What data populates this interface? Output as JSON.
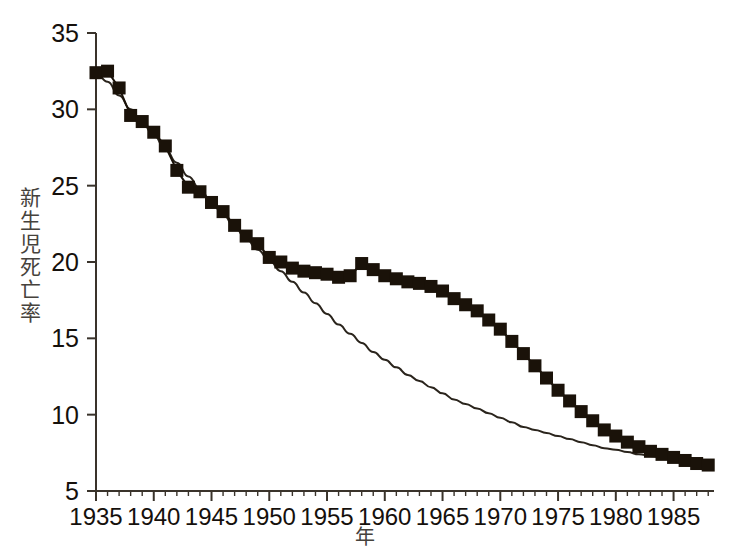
{
  "chart_data": {
    "type": "line",
    "title": "",
    "xlabel": "年",
    "ylabel": "新生児死亡率",
    "xlim": [
      1935,
      1988.5
    ],
    "ylim": [
      5,
      35
    ],
    "grid": false,
    "legend": "none",
    "xticks": [
      1935,
      1940,
      1945,
      1950,
      1955,
      1960,
      1965,
      1970,
      1975,
      1980,
      1985
    ],
    "xticklabels": [
      "1935",
      "1940",
      "1945",
      "1950",
      "1955",
      "1960",
      "1965",
      "1970",
      "1975",
      "1980",
      "1985"
    ],
    "yticks": [
      5,
      10,
      15,
      20,
      25,
      30,
      35
    ],
    "yticklabels": [
      "5",
      "10",
      "15",
      "20",
      "25",
      "30",
      "35"
    ],
    "minor_xtick_interval": 1,
    "x": [
      1935,
      1936,
      1937,
      1938,
      1939,
      1940,
      1941,
      1942,
      1943,
      1944,
      1945,
      1946,
      1947,
      1948,
      1949,
      1950,
      1951,
      1952,
      1953,
      1954,
      1955,
      1956,
      1957,
      1958,
      1959,
      1960,
      1961,
      1962,
      1963,
      1964,
      1965,
      1966,
      1967,
      1968,
      1969,
      1970,
      1971,
      1972,
      1973,
      1974,
      1975,
      1976,
      1977,
      1978,
      1979,
      1980,
      1981,
      1982,
      1983,
      1984,
      1985,
      1986,
      1987,
      1988
    ],
    "series": [
      {
        "name": "観測値",
        "marker": "square",
        "color": "#1a1209",
        "values": [
          32.4,
          32.5,
          31.4,
          29.6,
          29.2,
          28.5,
          27.6,
          26.0,
          24.9,
          24.6,
          23.9,
          23.3,
          22.4,
          21.7,
          21.2,
          20.3,
          20.0,
          19.6,
          19.4,
          19.3,
          19.2,
          19.0,
          19.1,
          19.9,
          19.5,
          19.1,
          18.9,
          18.7,
          18.6,
          18.4,
          18.1,
          17.6,
          17.2,
          16.8,
          16.2,
          15.6,
          14.8,
          14.0,
          13.2,
          12.4,
          11.6,
          10.9,
          10.2,
          9.6,
          9.0,
          8.6,
          8.2,
          7.9,
          7.6,
          7.4,
          7.2,
          7.0,
          6.8,
          6.7
        ]
      },
      {
        "name": "近似曲線",
        "marker": "none",
        "color": "#2a241c",
        "values": [
          32.4,
          31.8,
          30.9,
          30.0,
          29.1,
          28.3,
          27.4,
          26.5,
          25.6,
          24.8,
          23.9,
          23.1,
          22.3,
          21.5,
          20.8,
          20.1,
          19.4,
          18.7,
          18.0,
          17.3,
          16.6,
          15.9,
          15.3,
          14.7,
          14.1,
          13.6,
          13.1,
          12.6,
          12.2,
          11.8,
          11.4,
          11.0,
          10.7,
          10.4,
          10.1,
          9.8,
          9.5,
          9.2,
          9.0,
          8.8,
          8.6,
          8.4,
          8.2,
          8.0,
          7.8,
          7.7,
          7.55,
          7.4,
          7.3,
          7.2,
          7.1,
          7.0,
          6.9,
          6.8
        ]
      }
    ]
  },
  "axes": {
    "y_axis_name": "y-axis",
    "x_axis_name": "x-axis"
  }
}
